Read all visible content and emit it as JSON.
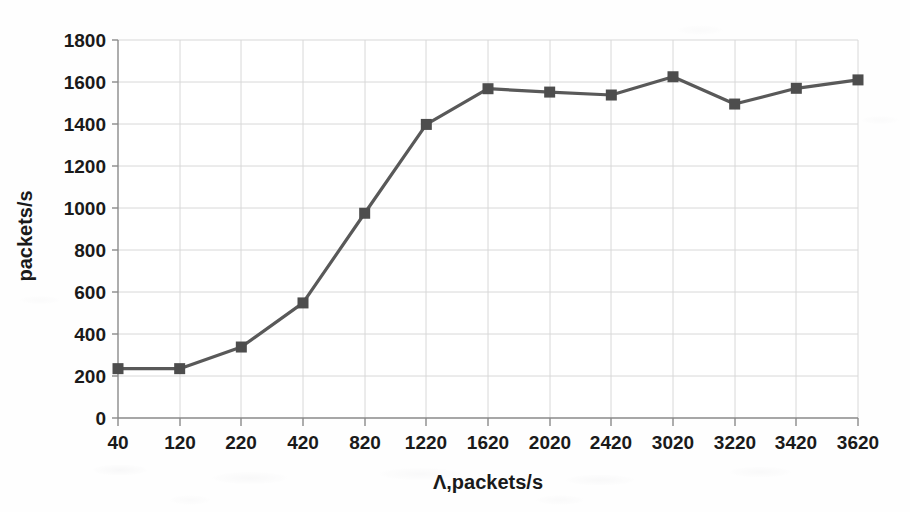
{
  "chart_data": {
    "type": "line",
    "title": "",
    "subtitle": "",
    "xlabel": "Λ,packets/s",
    "ylabel": "packets/s",
    "categories": [
      "40",
      "120",
      "220",
      "420",
      "820",
      "1220",
      "1620",
      "2020",
      "2420",
      "3020",
      "3220",
      "3420",
      "3620"
    ],
    "values": [
      235,
      235,
      338,
      548,
      975,
      1398,
      1568,
      1552,
      1538,
      1625,
      1495,
      1570,
      1610
    ],
    "series": [
      {
        "name": "throughput",
        "values": [
          235,
          235,
          338,
          548,
          975,
          1398,
          1568,
          1552,
          1538,
          1625,
          1495,
          1570,
          1610
        ]
      }
    ],
    "ylim": [
      0,
      1800
    ],
    "y_ticks": [
      "0",
      "200",
      "400",
      "600",
      "800",
      "1000",
      "1200",
      "1400",
      "1600",
      "1800"
    ],
    "x_tick_labels": [
      "40",
      "120",
      "220",
      "420",
      "820",
      "1220",
      "1620",
      "2020",
      "2420",
      "3020",
      "3220",
      "3420",
      "3620"
    ],
    "grid": "both",
    "legend": "none",
    "marker": "square",
    "line_color": "#595959",
    "marker_color": "#4d4d4d",
    "grid_color": "#d8d8d8",
    "axis_color": "#7a7a7a",
    "background_color": "#ffffff"
  },
  "axes": {
    "y_axis_title": "packets/s",
    "x_axis_title": "Λ,packets/s"
  }
}
